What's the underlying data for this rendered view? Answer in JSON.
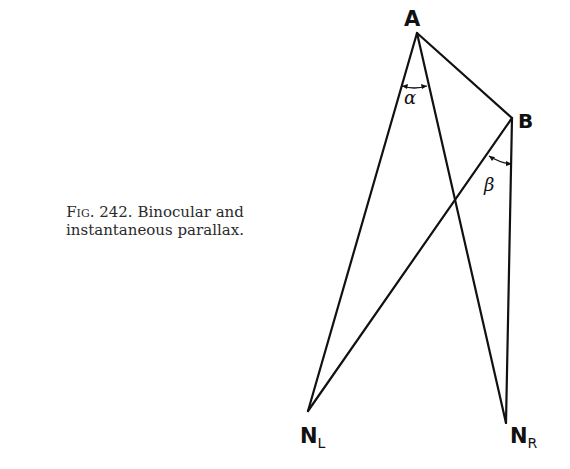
{
  "figure": {
    "caption_prefix": "Fig.",
    "caption_number": "242.",
    "caption_line1": "Binocular and",
    "caption_line2": "instantaneous parallax.",
    "points": {
      "A": {
        "label": "A",
        "x": 417,
        "y": 33
      },
      "B": {
        "label": "B",
        "x": 512,
        "y": 118
      },
      "NL": {
        "label": "N",
        "sub": "L",
        "x": 308,
        "y": 411
      },
      "NR": {
        "label": "N",
        "sub": "R",
        "x": 506,
        "y": 423
      }
    },
    "angles": [
      {
        "symbol": "α",
        "at": "A",
        "between": [
          "A-NL",
          "A-NR"
        ]
      },
      {
        "symbol": "β",
        "at": "B",
        "between": [
          "B-NL",
          "B-NR"
        ]
      }
    ],
    "line_color": "#111111"
  }
}
